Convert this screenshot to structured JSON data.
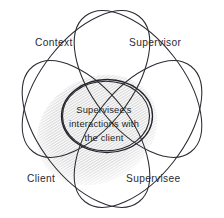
{
  "diagram": {
    "title": "Supervisee's interactions with the client",
    "type": "venn-four-set",
    "colors": {
      "stroke": "#2b2b33",
      "circle_stroke": "#23232a",
      "shade_fill": "#d8d8d8",
      "background": "#ffffff",
      "text": "#2a2a31"
    },
    "sets": [
      {
        "id": "context",
        "label": "Context",
        "position": "top-left"
      },
      {
        "id": "supervisor",
        "label": "Supervisor",
        "position": "top-right"
      },
      {
        "id": "client",
        "label": "Client",
        "position": "bottom-left"
      },
      {
        "id": "supervisee",
        "label": "Supervisee",
        "position": "bottom-right"
      }
    ],
    "center": {
      "id": "intersection",
      "lines": [
        "Supervisee's",
        "interactions with",
        "the client"
      ]
    }
  }
}
